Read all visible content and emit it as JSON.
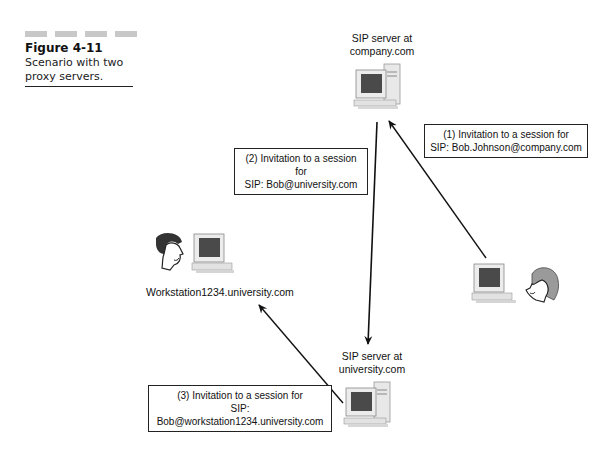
{
  "figure": {
    "number": "Figure 4-11",
    "caption": "Scenario with two proxy servers."
  },
  "nodes": {
    "company_server": {
      "label_line1": "SIP server at",
      "label_line2": "company.com",
      "icon": "server-computer-icon"
    },
    "university_server": {
      "label_line1": "SIP server at",
      "label_line2": "university.com",
      "icon": "server-computer-icon"
    },
    "workstation": {
      "label": "Workstation1234.university.com",
      "icon": "desktop-computer-icon",
      "person": "man-face-icon"
    },
    "caller": {
      "icon": "desktop-computer-icon",
      "person": "woman-face-icon"
    }
  },
  "messages": [
    {
      "line1": "(1) Invitation to a session for",
      "line2": "SIP: Bob.Johnson@company.com"
    },
    {
      "line1": "(2) Invitation to a session for",
      "line2": "SIP: Bob@university.com"
    },
    {
      "line1": "(3) Invitation to a session for",
      "line2": "SIP: Bob@workstation1234.university.com"
    }
  ],
  "colors": {
    "line": "#111111",
    "box_border": "#222222",
    "screen": "#4a4a4a",
    "case": "#e6e6e6"
  }
}
